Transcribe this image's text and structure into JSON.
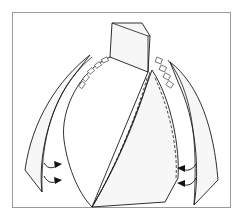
{
  "diagram": {
    "type": "paper-model-assembly-illustration",
    "parts": [
      {
        "name": "stem-top",
        "shape": "box"
      },
      {
        "name": "body",
        "shape": "ogive with diagonal glued seam and tabs"
      },
      {
        "name": "left-petals",
        "count": 2
      },
      {
        "name": "right-petals",
        "count": 2
      }
    ],
    "arrows": {
      "left": 2,
      "right": 2,
      "direction": "inward toward body"
    },
    "colors": {
      "line": "#1a1a1a",
      "fill": "#f7f7f7",
      "frame": "#9a9a9a",
      "background": "#ffffff"
    }
  }
}
